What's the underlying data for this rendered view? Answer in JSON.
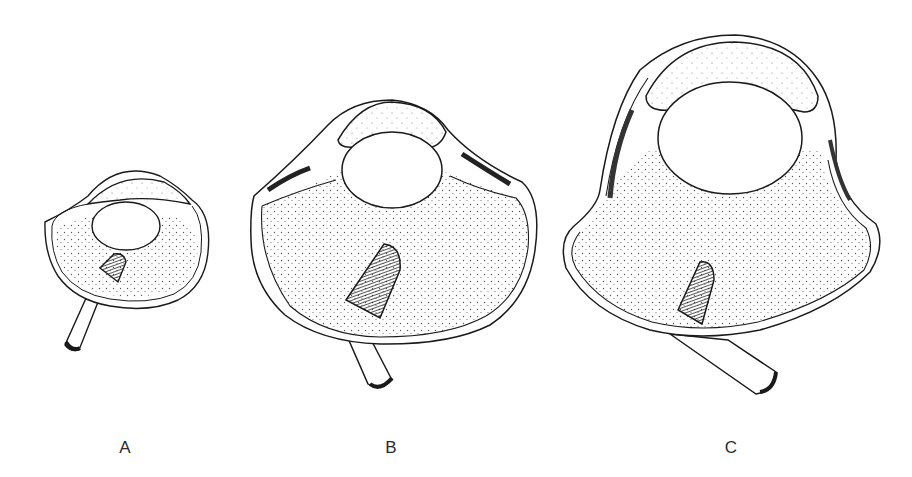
{
  "figure": {
    "stroke_color": "#1a1a1a",
    "fill_color": "#ffffff",
    "stipple_color": "#555555",
    "panels": [
      {
        "label": "A",
        "label_x": 125,
        "parts": [
          "cornea",
          "anterior chamber",
          "lens",
          "ciliary body",
          "vitreous body",
          "pecten",
          "optic nerve",
          "sclera"
        ]
      },
      {
        "label": "B",
        "label_x": 391,
        "parts": [
          "cornea",
          "anterior chamber",
          "lens",
          "ciliary body",
          "vitreous body",
          "pecten",
          "optic nerve",
          "sclera"
        ]
      },
      {
        "label": "C",
        "label_x": 731,
        "parts": [
          "cornea",
          "anterior chamber",
          "lens",
          "ciliary body",
          "vitreous body",
          "pecten",
          "optic nerve",
          "sclera"
        ]
      }
    ]
  }
}
